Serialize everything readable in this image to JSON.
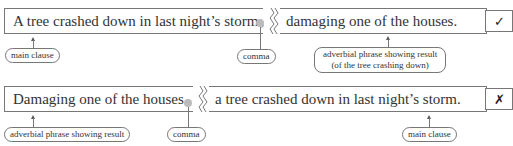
{
  "example_1": {
    "clause_a": "A tree crashed down in last night’s storm",
    "comma": ",",
    "clause_b": "damaging one of the houses.",
    "labels": {
      "main_clause": "main clause",
      "comma": "comma",
      "adverbial_line1": "adverbial phrase showing result",
      "adverbial_line2": "(of the tree crashing down)"
    },
    "verdict": "✓",
    "verdict_meaning": "correct"
  },
  "example_2": {
    "clause_a": "Damaging one of the houses",
    "comma": ",",
    "clause_b": "a tree crashed down in last night’s storm.",
    "labels": {
      "adverbial": "adverbial phrase showing result",
      "comma": "comma",
      "main_clause": "main clause"
    },
    "verdict": "✗",
    "verdict_meaning": "incorrect"
  }
}
